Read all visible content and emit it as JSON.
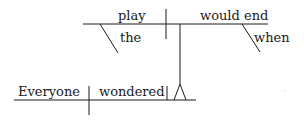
{
  "diagram": {
    "type": "sentence-diagram",
    "style": "Reed-Kellogg",
    "main_clause": {
      "subject": "Everyone",
      "verb": "wondered"
    },
    "noun_clause": {
      "subject": "play",
      "subject_modifier": "the",
      "verb": "would end",
      "verb_modifier": "when"
    }
  }
}
